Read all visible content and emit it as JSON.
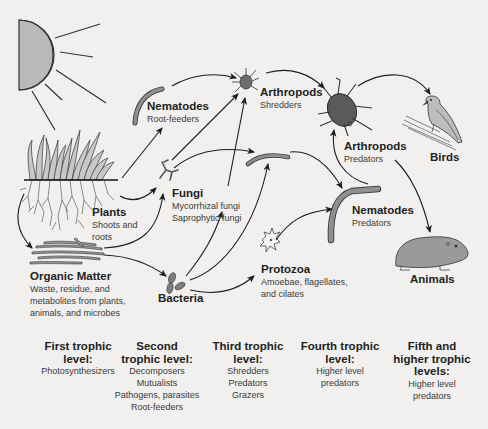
{
  "colors": {
    "background": "#f1f0ee",
    "organism_fill": "#8f8f8f",
    "organism_dark": "#4a4a4a",
    "sun_fill": "#b9b9b9",
    "arrow": "#1e1e1e",
    "text": "#222222"
  },
  "nodes": {
    "sun": {
      "icon": "sun-icon"
    },
    "nematodes_root": {
      "title": "Nematodes",
      "subtitle": "Root-feeders",
      "icon": "nematode-icon"
    },
    "arthropods_shredders": {
      "title": "Arthropods",
      "subtitle": "Shredders",
      "icon": "mite-icon"
    },
    "arthropods_predators": {
      "title": "Arthropods",
      "subtitle": "Predators",
      "icon": "beetle-icon"
    },
    "birds": {
      "title": "Birds",
      "icon": "bird-icon"
    },
    "plants": {
      "title": "Plants",
      "subtitle_line1": "Shoots and",
      "subtitle_line2": "roots",
      "icon": "grass-roots-icon"
    },
    "fungi": {
      "title": "Fungi",
      "subtitle_line1": "Mycorrhizal fungi",
      "subtitle_line2": "Saprophytic fungi",
      "icon": "fungi-hyphae-icon"
    },
    "nematodes_predators": {
      "title": "Nematodes",
      "subtitle": "Predators",
      "icon": "nematode-icon"
    },
    "organic_matter": {
      "title": "Organic Matter",
      "subtitle_line1": "Waste, residue, and",
      "subtitle_line2": "metabolites from plants,",
      "subtitle_line3": "animals, and microbes",
      "icon": "organic-matter-icon"
    },
    "bacteria": {
      "title": "Bacteria",
      "icon": "bacteria-icon"
    },
    "protozoa": {
      "title": "Protozoa",
      "subtitle_line1": "Amoebae, flagellates,",
      "subtitle_line2": "and cilates",
      "icon": "protozoa-icon"
    },
    "animals": {
      "title": "Animals",
      "icon": "mammal-icon"
    },
    "middle_nematode": {
      "icon": "nematode-icon"
    }
  },
  "trophic_levels": [
    {
      "heading_line1": "First trophic",
      "heading_line2": "level:",
      "items": [
        "Photosynthesizers"
      ]
    },
    {
      "heading_line1": "Second",
      "heading_line2": "trophic level:",
      "items": [
        "Decomposers",
        "Mutualists",
        "Pathogens, parasites",
        "Root-feeders"
      ]
    },
    {
      "heading_line1": "Third trophic",
      "heading_line2": "level:",
      "items": [
        "Shredders",
        "Predators",
        "Grazers"
      ]
    },
    {
      "heading_line1": "Fourth trophic",
      "heading_line2": "level:",
      "items": [
        "Higher level",
        "predators"
      ]
    },
    {
      "heading_line1": "Fifth and",
      "heading_line2": "higher trophic",
      "heading_line3": "levels:",
      "items": [
        "Higher level",
        "predators"
      ]
    }
  ],
  "edges": [
    {
      "from": "plants",
      "to": "nematodes_root"
    },
    {
      "from": "plants",
      "to": "fungi"
    },
    {
      "from": "plants",
      "to": "organic_matter"
    },
    {
      "from": "organic_matter",
      "to": "fungi"
    },
    {
      "from": "organic_matter",
      "to": "bacteria"
    },
    {
      "from": "nematodes_root",
      "to": "arthropods_shredders"
    },
    {
      "from": "fungi",
      "to": "arthropods_shredders"
    },
    {
      "from": "fungi",
      "to": "middle_nematode"
    },
    {
      "from": "bacteria",
      "to": "arthropods_shredders"
    },
    {
      "from": "bacteria",
      "to": "middle_nematode"
    },
    {
      "from": "bacteria",
      "to": "protozoa"
    },
    {
      "from": "protozoa",
      "to": "nematodes_predators"
    },
    {
      "from": "middle_nematode",
      "to": "nematodes_predators"
    },
    {
      "from": "arthropods_shredders",
      "to": "arthropods_predators"
    },
    {
      "from": "nematodes_predators",
      "to": "arthropods_predators"
    },
    {
      "from": "arthropods_predators",
      "to": "birds"
    },
    {
      "from": "arthropods_predators",
      "to": "animals"
    }
  ]
}
